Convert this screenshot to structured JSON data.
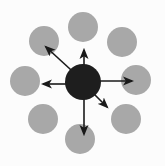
{
  "canvas": {
    "width": 165,
    "height": 166,
    "background": "#fcfcfc"
  },
  "diagram": {
    "type": "hub-and-spoke",
    "hub": {
      "name": "hub-node",
      "cx": 83,
      "cy": 82,
      "r": 18,
      "fill": "#1e1e1e"
    },
    "satellite_fill": "#a8a8a8",
    "satellites": [
      {
        "name": "node-top",
        "cx": 83,
        "cy": 27,
        "r": 15
      },
      {
        "name": "node-top-right",
        "cx": 122,
        "cy": 42,
        "r": 15
      },
      {
        "name": "node-right",
        "cx": 136,
        "cy": 80,
        "r": 15
      },
      {
        "name": "node-bottom-right",
        "cx": 126,
        "cy": 119,
        "r": 15
      },
      {
        "name": "node-bottom",
        "cx": 80,
        "cy": 139,
        "r": 15
      },
      {
        "name": "node-bottom-left",
        "cx": 43,
        "cy": 119,
        "r": 15
      },
      {
        "name": "node-left",
        "cx": 25,
        "cy": 81,
        "r": 15
      },
      {
        "name": "node-top-left",
        "cx": 44,
        "cy": 41,
        "r": 15
      }
    ],
    "arrow_color": "#1a1a1a",
    "arrow_width": 1.6,
    "arrows": [
      {
        "name": "arrow-up",
        "x1": 84,
        "y1": 74,
        "x2": 84,
        "y2": 50
      },
      {
        "name": "arrow-up-left",
        "x1": 82,
        "y1": 80,
        "x2": 46,
        "y2": 47
      },
      {
        "name": "arrow-left",
        "x1": 70,
        "y1": 84,
        "x2": 43,
        "y2": 84
      },
      {
        "name": "arrow-right",
        "x1": 98,
        "y1": 81,
        "x2": 132,
        "y2": 81
      },
      {
        "name": "arrow-down",
        "x1": 84,
        "y1": 96,
        "x2": 84,
        "y2": 134
      },
      {
        "name": "arrow-down-right",
        "x1": 94,
        "y1": 94,
        "x2": 107,
        "y2": 107
      }
    ]
  }
}
